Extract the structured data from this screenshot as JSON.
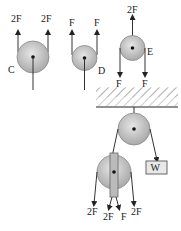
{
  "diagram": {
    "pulley_c": {
      "label": "C",
      "forces": [
        "2F",
        "2F"
      ]
    },
    "pulley_d": {
      "label": "D",
      "forces": [
        "F",
        "F"
      ]
    },
    "pulley_e": {
      "label": "E",
      "forces": {
        "up": "2F",
        "down": [
          "F",
          "F"
        ]
      }
    },
    "system": {
      "weight_label": "W",
      "bottom_forces": [
        "2F",
        "2F",
        "F",
        "2F"
      ]
    }
  }
}
